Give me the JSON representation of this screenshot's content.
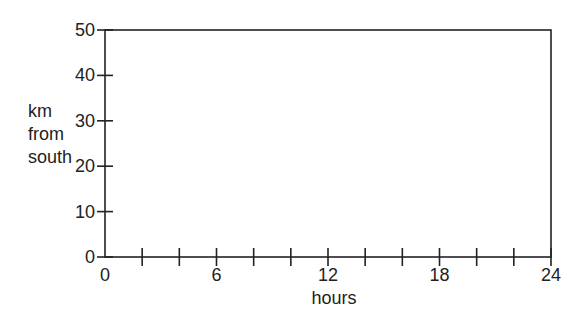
{
  "chart_data": {
    "type": "line",
    "title": "",
    "xlabel": "hours",
    "ylabel": [
      "km",
      "from",
      "south"
    ],
    "xlim": [
      0,
      24
    ],
    "ylim": [
      0,
      50
    ],
    "x_tick_labels": [
      "0",
      "6",
      "12",
      "18",
      "24"
    ],
    "x_tick_values": [
      0,
      6,
      12,
      18,
      24
    ],
    "x_minor_ticks": [
      2,
      4,
      8,
      10,
      14,
      16,
      20,
      22
    ],
    "y_tick_labels": [
      "0",
      "10",
      "20",
      "30",
      "40",
      "50"
    ],
    "y_tick_values": [
      0,
      10,
      20,
      30,
      40,
      50
    ],
    "series": [],
    "grid": false,
    "legend": null
  }
}
